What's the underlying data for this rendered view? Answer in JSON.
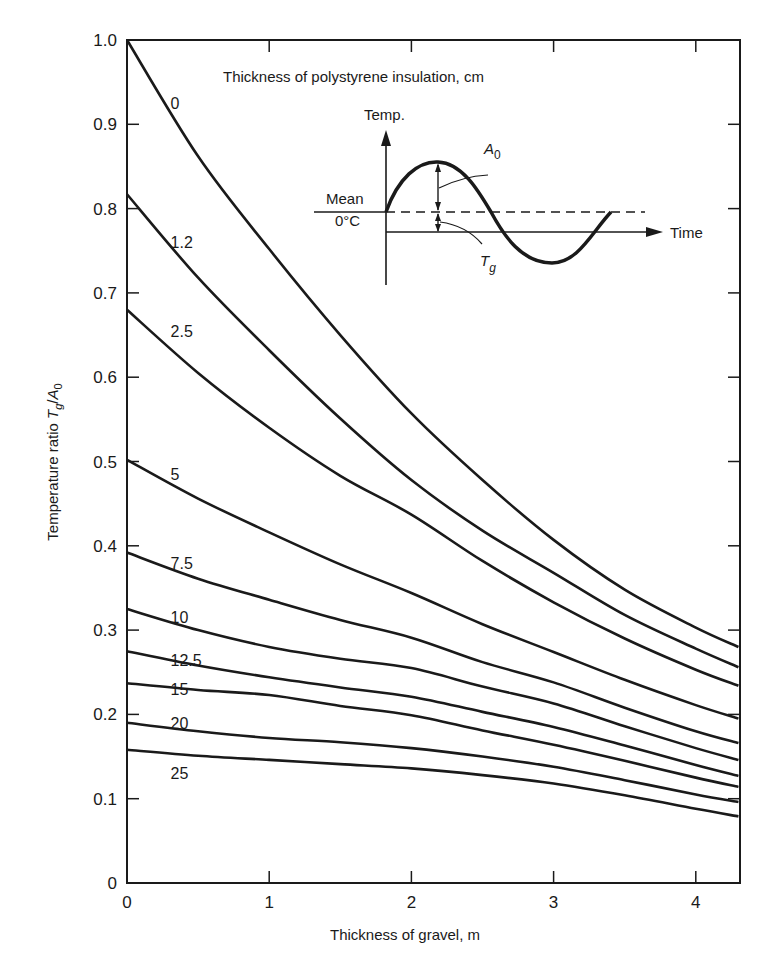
{
  "chart_data": {
    "type": "line",
    "title": "Thickness of polystyrene insulation, cm",
    "xlabel": "Thickness of gravel, m",
    "ylabel": "Temperature ratio T_g/A_0",
    "ylabel_parts": {
      "main": "Temperature ratio ",
      "T": "T",
      "g": "g",
      "slash": "/",
      "A": "A",
      "zero": "0"
    },
    "xlim": [
      0,
      4.3
    ],
    "ylim": [
      0,
      1.0
    ],
    "grid": false,
    "legend_position": "inline curve labels",
    "x_ticks": [
      0,
      1,
      2,
      3,
      4
    ],
    "x_tick_labels": [
      "0",
      "1",
      "2",
      "3",
      "4"
    ],
    "y_ticks": [
      0,
      0.1,
      0.2,
      0.3,
      0.4,
      0.5,
      0.6,
      0.7,
      0.8,
      0.9,
      1.0
    ],
    "y_tick_labels": [
      "0",
      "0.1",
      "0.2",
      "0.3",
      "0.4",
      "0.5",
      "0.6",
      "0.7",
      "0.8",
      "0.9",
      "1.0"
    ],
    "x": [
      0,
      0.5,
      1,
      1.5,
      2,
      2.5,
      3,
      3.5,
      4,
      4.3
    ],
    "series": [
      {
        "name": "0",
        "values": [
          1.0,
          0.862,
          0.752,
          0.65,
          0.557,
          0.478,
          0.407,
          0.348,
          0.303,
          0.28
        ]
      },
      {
        "name": "1.2",
        "values": [
          0.817,
          0.718,
          0.632,
          0.551,
          0.478,
          0.418,
          0.368,
          0.318,
          0.278,
          0.256
        ]
      },
      {
        "name": "2.5",
        "values": [
          0.68,
          0.605,
          0.54,
          0.483,
          0.437,
          0.382,
          0.333,
          0.29,
          0.253,
          0.234
        ]
      },
      {
        "name": "5",
        "values": [
          0.502,
          0.456,
          0.416,
          0.378,
          0.344,
          0.307,
          0.274,
          0.241,
          0.211,
          0.195
        ]
      },
      {
        "name": "7.5",
        "values": [
          0.392,
          0.361,
          0.336,
          0.312,
          0.291,
          0.262,
          0.238,
          0.208,
          0.18,
          0.166
        ]
      },
      {
        "name": "10",
        "values": [
          0.325,
          0.3,
          0.28,
          0.266,
          0.255,
          0.233,
          0.213,
          0.186,
          0.16,
          0.146
        ]
      },
      {
        "name": "12.5",
        "values": [
          0.275,
          0.258,
          0.244,
          0.232,
          0.221,
          0.203,
          0.185,
          0.163,
          0.14,
          0.127
        ]
      },
      {
        "name": "15",
        "values": [
          0.237,
          0.229,
          0.223,
          0.21,
          0.199,
          0.181,
          0.164,
          0.145,
          0.125,
          0.114
        ]
      },
      {
        "name": "20",
        "values": [
          0.19,
          0.18,
          0.172,
          0.167,
          0.16,
          0.15,
          0.138,
          0.122,
          0.105,
          0.096
        ]
      },
      {
        "name": "25",
        "values": [
          0.158,
          0.151,
          0.146,
          0.141,
          0.136,
          0.128,
          0.118,
          0.104,
          0.088,
          0.079
        ]
      }
    ],
    "curve_label_positions": [
      {
        "name": "0",
        "x": 0.25,
        "y": 0.925
      },
      {
        "name": "1.2",
        "x": 0.25,
        "y": 0.76
      },
      {
        "name": "2.5",
        "x": 0.25,
        "y": 0.655
      },
      {
        "name": "5",
        "x": 0.25,
        "y": 0.485
      },
      {
        "name": "7.5",
        "x": 0.25,
        "y": 0.38
      },
      {
        "name": "10",
        "x": 0.25,
        "y": 0.315
      },
      {
        "name": "12.5",
        "x": 0.25,
        "y": 0.265
      },
      {
        "name": "15",
        "x": 0.25,
        "y": 0.23
      },
      {
        "name": "20",
        "x": 0.25,
        "y": 0.19
      },
      {
        "name": "25",
        "x": 0.25,
        "y": 0.13
      }
    ],
    "inset": {
      "description": "Sinusoidal surface temperature about a mean above 0°C",
      "y_axis_label": "Temp.",
      "x_axis_label": "Time",
      "mean_label": "Mean",
      "zero_label": "0°C",
      "amplitude_label": {
        "main": "A",
        "sub": "0"
      },
      "ground_temp_label": {
        "main": "T",
        "sub": "g"
      }
    }
  },
  "colors": {
    "ink": "#1a1a1a",
    "background": "#ffffff"
  }
}
